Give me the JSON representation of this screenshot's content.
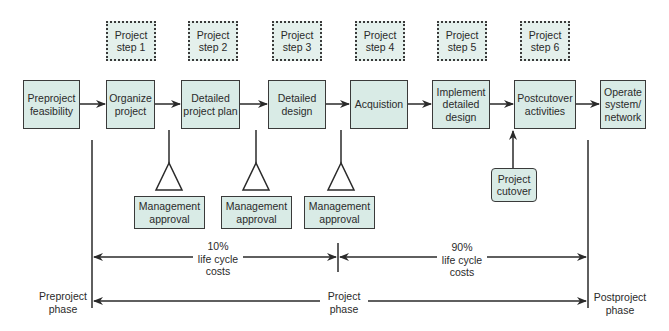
{
  "diagram": {
    "type": "project-life-cycle-flow",
    "colors": {
      "box_fill": "#d9ebe6",
      "step_fill": "#e4f0ec",
      "line": "#2a2a2a"
    },
    "project_steps": [
      {
        "label": "Project\nstep 1"
      },
      {
        "label": "Project\nstep 2"
      },
      {
        "label": "Project\nstep 3"
      },
      {
        "label": "Project\nstep 4"
      },
      {
        "label": "Project\nstep 5"
      },
      {
        "label": "Project\nstep 6"
      }
    ],
    "stages": [
      {
        "label": "Preproject\nfeasibility"
      },
      {
        "label": "Organize\nproject"
      },
      {
        "label": "Detailed\nproject plan"
      },
      {
        "label": "Detailed\ndesign"
      },
      {
        "label": "Acquistion"
      },
      {
        "label": "Implement\ndetailed\ndesign"
      },
      {
        "label": "Postcutover\nactivities"
      },
      {
        "label": "Operate\nsystem/\nnetwork"
      }
    ],
    "approvals": [
      {
        "label": "Management\napproval"
      },
      {
        "label": "Management\napproval"
      },
      {
        "label": "Management\napproval"
      }
    ],
    "cutover": {
      "label": "Project\ncutover"
    },
    "costs": [
      {
        "label": "10%\nlife cycle\ncosts"
      },
      {
        "label": "90%\nlife cycle\ncosts"
      }
    ],
    "phases": [
      {
        "label": "Preproject\nphase"
      },
      {
        "label": "Project\nphase"
      },
      {
        "label": "Postproject\nphase"
      }
    ]
  }
}
